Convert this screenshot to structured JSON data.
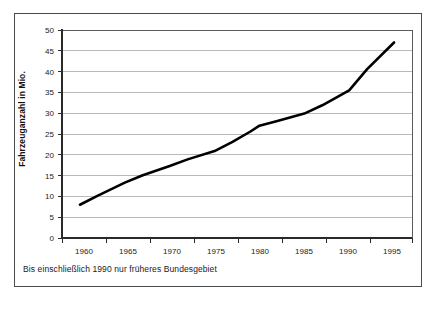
{
  "chart_data": {
    "type": "line",
    "title": "",
    "subtitle": "",
    "xlabel": "",
    "ylabel": "Fahrzeuganzahl in Mio.",
    "xlim": [
      1958,
      1997
    ],
    "ylim": [
      0,
      50
    ],
    "ytick_step": 5,
    "grid": true,
    "grid_axis": "y",
    "legend": false,
    "legend_position": "none",
    "xtick_labels": [
      "1960",
      "1965",
      "1970",
      "1975",
      "1980",
      "1985",
      "1990",
      "1995"
    ],
    "ytick_labels": [
      "0",
      "5",
      "10",
      "15",
      "20",
      "25",
      "30",
      "35",
      "40",
      "45",
      "50"
    ],
    "annotation": "Bis einschließlich 1990 nur früheres Bundesgebiet",
    "series": [
      {
        "name": "Fahrzeuganzahl",
        "color": "#000000",
        "x": [
          1960,
          1962,
          1965,
          1967,
          1970,
          1972,
          1975,
          1977,
          1979,
          1980,
          1982,
          1985,
          1987,
          1990,
          1992,
          1995
        ],
        "values": [
          8.0,
          10.2,
          13.3,
          15.1,
          17.3,
          18.9,
          20.9,
          23.1,
          25.6,
          27.0,
          28.1,
          29.9,
          31.9,
          35.5,
          40.6,
          47.0
        ]
      }
    ]
  },
  "axis": {
    "y_title": "Fahrzeuganzahl in Mio.",
    "y_ticks": [
      "50",
      "45",
      "40",
      "35",
      "30",
      "25",
      "20",
      "15",
      "10",
      "5",
      "0"
    ],
    "x_ticks": [
      "1960",
      "1965",
      "1970",
      "1975",
      "1980",
      "1985",
      "1990",
      "1995"
    ]
  },
  "footnote": {
    "text": "Bis einschließlich 1990 nur früheres Bundesgebiet"
  },
  "colors": {
    "series": "#000000",
    "grid": "#9b9b9b",
    "frame": "#4a4a4a",
    "background": "#ffffff"
  }
}
